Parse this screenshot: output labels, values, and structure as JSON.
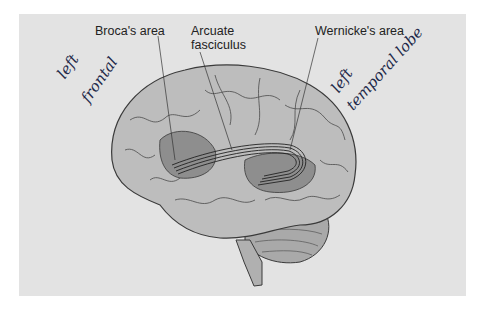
{
  "figure": {
    "background": "#e3e3e3",
    "labels": {
      "broca": "Broca's area",
      "arcuate_line1": "Arcuate",
      "arcuate_line2": "fasciculus",
      "wernicke": "Wernicke's area"
    },
    "handwritten": {
      "left_frontal_line1": "left",
      "left_frontal_line2": "frontal",
      "left_temporal_line1": "left",
      "left_temporal_line2": "temporal lobe"
    },
    "colors": {
      "brain_fill": "#bdbdbd",
      "brain_outline": "#3a3a3a",
      "highlight_region": "#8e8e8e",
      "ink": "#1f2a4a"
    }
  }
}
